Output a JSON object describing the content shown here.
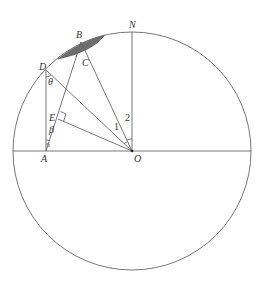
{
  "diagram": {
    "type": "geometry-circle",
    "circle": {
      "cx": 132,
      "cy": 151,
      "r": 119
    },
    "points": {
      "N": {
        "label": "N",
        "x": 132,
        "y": 32
      },
      "O": {
        "label": "O",
        "x": 132,
        "y": 151
      },
      "A": {
        "label": "A",
        "x": 46,
        "y": 151
      },
      "B": {
        "label": "B",
        "x": 81,
        "y": 42
      },
      "C": {
        "label": "C",
        "x": 86,
        "y": 57
      },
      "D": {
        "label": "D",
        "x": 46,
        "y": 70
      },
      "E": {
        "label": "E",
        "x": 58,
        "y": 119
      }
    },
    "angle_labels": {
      "theta": "θ",
      "beta": "β",
      "one": "1",
      "two": "2"
    },
    "shaded_segment": {
      "color": "#6e6e6e"
    },
    "line_color": "#666666"
  }
}
